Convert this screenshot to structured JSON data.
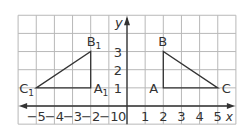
{
  "figure": {
    "grid": {
      "x_min": -6,
      "x_max": 6,
      "y_min": -1,
      "y_max": 5,
      "origin_px": [
        127,
        106
      ],
      "unit_px": 18.15,
      "line_color": "#b8b8b8",
      "axis_color": "#333333"
    },
    "axes": {
      "x_label": "x",
      "y_label": "y",
      "origin_label": "0",
      "x_ticks": [
        {
          "value": -5,
          "label": "−5"
        },
        {
          "value": -4,
          "label": "−4"
        },
        {
          "value": -3,
          "label": "−3"
        },
        {
          "value": -2,
          "label": "−2"
        },
        {
          "value": -1,
          "label": "−1"
        },
        {
          "value": 1,
          "label": "1"
        },
        {
          "value": 2,
          "label": "2"
        },
        {
          "value": 3,
          "label": "3"
        },
        {
          "value": 4,
          "label": "4"
        },
        {
          "value": 5,
          "label": "5"
        }
      ],
      "y_ticks": [
        {
          "value": 1,
          "label": "1"
        },
        {
          "value": 2,
          "label": "2"
        },
        {
          "value": 3,
          "label": "3"
        }
      ]
    },
    "triangles": [
      {
        "name": "ABC",
        "vertices": [
          {
            "label": "A",
            "sub": "",
            "x": 2,
            "y": 1
          },
          {
            "label": "B",
            "sub": "",
            "x": 2,
            "y": 3
          },
          {
            "label": "C",
            "sub": "",
            "x": 5,
            "y": 1
          }
        ]
      },
      {
        "name": "A1B1C1",
        "vertices": [
          {
            "label": "A",
            "sub": "1",
            "x": -2,
            "y": 1
          },
          {
            "label": "B",
            "sub": "1",
            "x": -2,
            "y": 3
          },
          {
            "label": "C",
            "sub": "1",
            "x": -5,
            "y": 1
          }
        ]
      }
    ]
  }
}
